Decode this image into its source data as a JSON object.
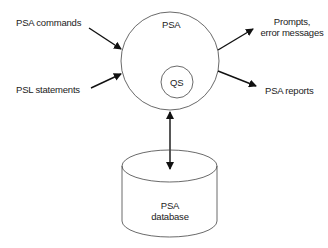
{
  "diagram": {
    "main_process": {
      "label": "PSA"
    },
    "sub_process": {
      "label": "QS"
    },
    "database": {
      "label_line1": "PSA",
      "label_line2": "database"
    },
    "inputs": [
      {
        "label": "PSA commands"
      },
      {
        "label": "PSL statements"
      }
    ],
    "outputs": [
      {
        "label_line1": "Prompts,",
        "label_line2": "error messages"
      },
      {
        "label": "PSA reports"
      }
    ],
    "connections": [
      {
        "from": "PSA commands",
        "to": "PSA",
        "type": "arrow"
      },
      {
        "from": "PSL statements",
        "to": "PSA",
        "type": "arrow"
      },
      {
        "from": "PSA",
        "to": "Prompts, error messages",
        "type": "arrow"
      },
      {
        "from": "PSA",
        "to": "PSA reports",
        "type": "arrow"
      },
      {
        "from": "PSA",
        "to": "PSA database",
        "type": "bidirectional-arrow"
      }
    ]
  }
}
